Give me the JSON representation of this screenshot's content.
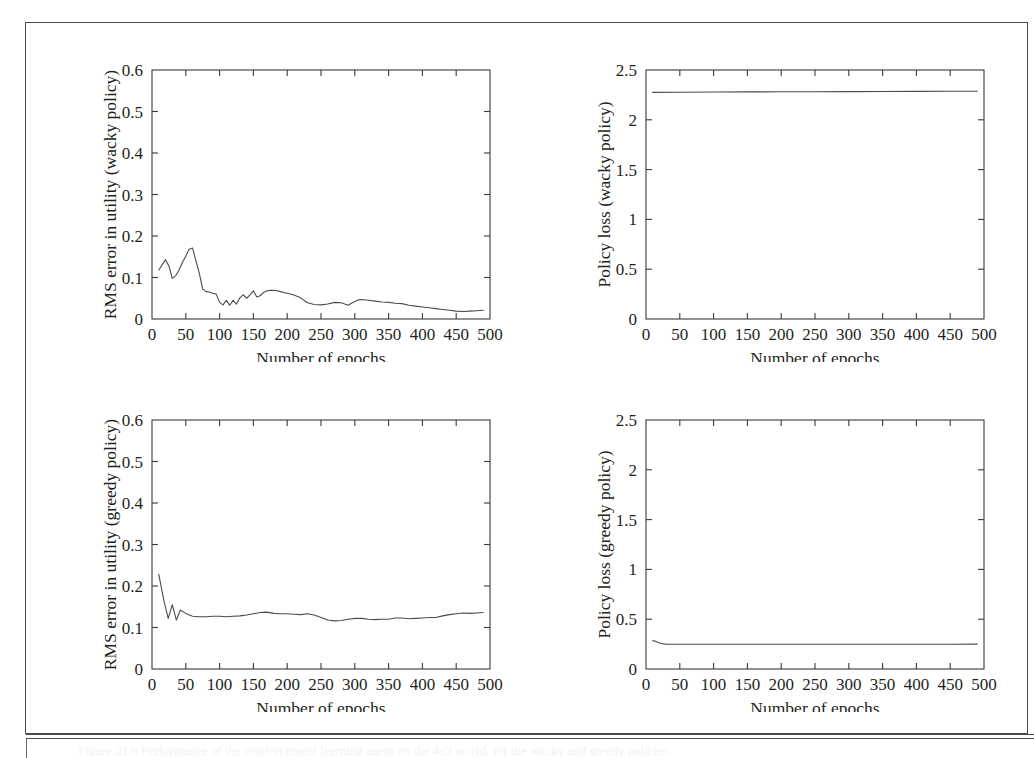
{
  "page": {
    "caption_sliver": "Figure 21.6 Performance of the reinforcement learning agent on the 4x3 world, for the wacky and greedy policies."
  },
  "panels": [
    {
      "id": "top-left",
      "ylabel": "RMS error in utility (wacky policy)",
      "xlabel": "Number of epochs"
    },
    {
      "id": "top-right",
      "ylabel": "Policy loss (wacky policy)",
      "xlabel": "Number of epochs"
    },
    {
      "id": "bottom-left",
      "ylabel": "RMS error in utility (greedy policy)",
      "xlabel": "Number of epochs"
    },
    {
      "id": "bottom-right",
      "ylabel": "Policy loss (greedy policy)",
      "xlabel": "Number of epochs"
    }
  ],
  "chart_data": [
    {
      "type": "line",
      "panel": "top-left",
      "title": "",
      "xlabel": "Number of epochs",
      "ylabel": "RMS error in utility (wacky policy)",
      "xlim": [
        0,
        500
      ],
      "ylim": [
        0,
        0.6
      ],
      "xticks": [
        0,
        50,
        100,
        150,
        200,
        250,
        300,
        350,
        400,
        450,
        500
      ],
      "yticks": [
        0,
        0.1,
        0.2,
        0.3,
        0.4,
        0.5,
        0.6
      ],
      "xtick_labels": [
        "0",
        "50",
        "100",
        "150",
        "200",
        "250",
        "300",
        "350",
        "400",
        "450",
        "500"
      ],
      "ytick_labels": [
        "0",
        "0.1",
        "0.2",
        "0.3",
        "0.4",
        "0.5",
        "0.6"
      ],
      "grid": false,
      "legend": "none",
      "line_color": "#4b4b4b",
      "series": [
        {
          "name": "RMS error (wacky)",
          "x": [
            10,
            20,
            25,
            30,
            35,
            40,
            45,
            50,
            55,
            60,
            65,
            70,
            75,
            80,
            85,
            90,
            95,
            100,
            105,
            110,
            115,
            120,
            125,
            130,
            135,
            140,
            145,
            150,
            155,
            160,
            165,
            170,
            175,
            180,
            185,
            190,
            195,
            200,
            210,
            220,
            230,
            240,
            250,
            260,
            270,
            280,
            290,
            295,
            300,
            305,
            310,
            320,
            330,
            340,
            350,
            360,
            370,
            380,
            390,
            400,
            410,
            420,
            430,
            440,
            450,
            460,
            470,
            480,
            490
          ],
          "y": [
            0.118,
            0.143,
            0.128,
            0.098,
            0.104,
            0.118,
            0.136,
            0.152,
            0.168,
            0.171,
            0.14,
            0.11,
            0.072,
            0.066,
            0.065,
            0.062,
            0.06,
            0.04,
            0.034,
            0.045,
            0.033,
            0.045,
            0.036,
            0.051,
            0.058,
            0.05,
            0.058,
            0.068,
            0.053,
            0.056,
            0.064,
            0.068,
            0.069,
            0.069,
            0.068,
            0.066,
            0.064,
            0.062,
            0.058,
            0.051,
            0.039,
            0.035,
            0.034,
            0.036,
            0.04,
            0.039,
            0.033,
            0.038,
            0.042,
            0.046,
            0.047,
            0.045,
            0.043,
            0.041,
            0.04,
            0.038,
            0.037,
            0.033,
            0.031,
            0.029,
            0.027,
            0.025,
            0.023,
            0.021,
            0.019,
            0.018,
            0.019,
            0.02,
            0.021
          ]
        }
      ]
    },
    {
      "type": "line",
      "panel": "top-right",
      "title": "",
      "xlabel": "Number of epochs",
      "ylabel": "Policy loss (wacky policy)",
      "xlim": [
        0,
        500
      ],
      "ylim": [
        0,
        2.5
      ],
      "xticks": [
        0,
        50,
        100,
        150,
        200,
        250,
        300,
        350,
        400,
        450,
        500
      ],
      "yticks": [
        0,
        0.5,
        1,
        1.5,
        2,
        2.5
      ],
      "xtick_labels": [
        "0",
        "50",
        "100",
        "150",
        "200",
        "250",
        "300",
        "350",
        "400",
        "450",
        "500"
      ],
      "ytick_labels": [
        "0",
        "0.5",
        "1",
        "1.5",
        "2",
        "2.5"
      ],
      "grid": false,
      "legend": "none",
      "line_color": "#4b4b4b",
      "series": [
        {
          "name": "Policy loss (wacky)",
          "x": [
            10,
            50,
            100,
            150,
            200,
            250,
            300,
            350,
            400,
            450,
            490
          ],
          "y": [
            2.275,
            2.277,
            2.279,
            2.28,
            2.281,
            2.282,
            2.283,
            2.284,
            2.285,
            2.286,
            2.287
          ]
        }
      ]
    },
    {
      "type": "line",
      "panel": "bottom-left",
      "title": "",
      "xlabel": "Number of epochs",
      "ylabel": "RMS error in utility (greedy policy)",
      "xlim": [
        0,
        500
      ],
      "ylim": [
        0,
        0.6
      ],
      "xticks": [
        0,
        50,
        100,
        150,
        200,
        250,
        300,
        350,
        400,
        450,
        500
      ],
      "yticks": [
        0,
        0.1,
        0.2,
        0.3,
        0.4,
        0.5,
        0.6
      ],
      "xtick_labels": [
        "0",
        "50",
        "100",
        "150",
        "200",
        "250",
        "300",
        "350",
        "400",
        "450",
        "500"
      ],
      "ytick_labels": [
        "0",
        "0.1",
        "0.2",
        "0.3",
        "0.4",
        "0.5",
        "0.6"
      ],
      "grid": false,
      "legend": "none",
      "line_color": "#4b4b4b",
      "series": [
        {
          "name": "RMS error (greedy)",
          "x": [
            10,
            18,
            24,
            30,
            36,
            42,
            50,
            60,
            70,
            80,
            90,
            100,
            110,
            120,
            130,
            140,
            150,
            160,
            170,
            180,
            190,
            200,
            210,
            220,
            230,
            240,
            250,
            260,
            270,
            280,
            290,
            300,
            310,
            320,
            330,
            340,
            350,
            360,
            370,
            380,
            390,
            400,
            410,
            420,
            430,
            440,
            450,
            460,
            470,
            480,
            490
          ],
          "y": [
            0.228,
            0.162,
            0.122,
            0.155,
            0.118,
            0.142,
            0.134,
            0.127,
            0.126,
            0.126,
            0.127,
            0.127,
            0.126,
            0.127,
            0.128,
            0.13,
            0.133,
            0.136,
            0.137,
            0.134,
            0.133,
            0.133,
            0.132,
            0.131,
            0.133,
            0.13,
            0.124,
            0.118,
            0.116,
            0.117,
            0.12,
            0.122,
            0.122,
            0.12,
            0.119,
            0.12,
            0.12,
            0.123,
            0.123,
            0.121,
            0.122,
            0.123,
            0.124,
            0.124,
            0.128,
            0.131,
            0.133,
            0.135,
            0.134,
            0.135,
            0.136
          ]
        }
      ]
    },
    {
      "type": "line",
      "panel": "bottom-right",
      "title": "",
      "xlabel": "Number of epochs",
      "ylabel": "Policy loss (greedy policy)",
      "xlim": [
        0,
        500
      ],
      "ylim": [
        0,
        2.5
      ],
      "xticks": [
        0,
        50,
        100,
        150,
        200,
        250,
        300,
        350,
        400,
        450,
        500
      ],
      "yticks": [
        0,
        0.5,
        1,
        1.5,
        2,
        2.5
      ],
      "xtick_labels": [
        "0",
        "50",
        "100",
        "150",
        "200",
        "250",
        "300",
        "350",
        "400",
        "450",
        "500"
      ],
      "ytick_labels": [
        "0",
        "0.5",
        "1",
        "1.5",
        "2",
        "2.5"
      ],
      "grid": false,
      "legend": "none",
      "line_color": "#4b4b4b",
      "series": [
        {
          "name": "Policy loss (greedy)",
          "x": [
            10,
            14,
            18,
            22,
            26,
            30,
            40,
            60,
            100,
            150,
            200,
            250,
            300,
            350,
            400,
            450,
            490
          ],
          "y": [
            0.285,
            0.278,
            0.266,
            0.256,
            0.252,
            0.25,
            0.249,
            0.248,
            0.248,
            0.248,
            0.248,
            0.248,
            0.248,
            0.249,
            0.249,
            0.249,
            0.25
          ]
        }
      ]
    }
  ]
}
